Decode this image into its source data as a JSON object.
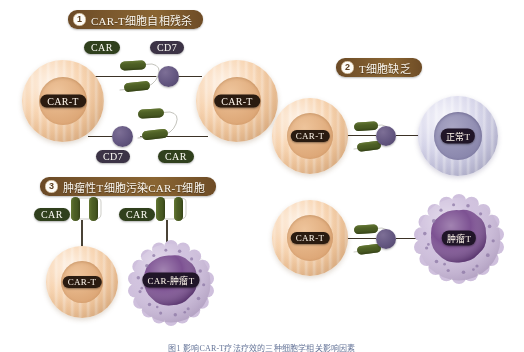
{
  "figure": {
    "background_color": "#ffffff",
    "caption": "图1 影响CAR-T疗法疗效的三种细胞学相关影响因素"
  },
  "palette": {
    "banner_brown": "#7d5a2e",
    "cart_peach": "#f6cfa8",
    "cart_nucleus": "#e3b183",
    "normal_t_lavender": "#d3d2e8",
    "normal_t_nucleus": "#9390b4",
    "tumor_membrane": "#cfc0dd",
    "tumor_nucleus": "#7a4e90",
    "car_green": "#4a5c24",
    "cd7_purple": "#655882",
    "plaque_dark": "#2a1b10"
  },
  "panels": [
    {
      "number": "1",
      "title": "CAR-T细胞自相残杀",
      "cells": [
        {
          "label": "CAR-T",
          "type": "cart"
        },
        {
          "label": "CAR-T",
          "type": "cart"
        }
      ],
      "markers": [
        {
          "name": "CAR",
          "position": "top-left"
        },
        {
          "name": "CD7",
          "position": "top-right"
        },
        {
          "name": "CD7",
          "position": "bottom-left"
        },
        {
          "name": "CAR",
          "position": "bottom-right"
        }
      ]
    },
    {
      "number": "2",
      "title": "T细胞缺乏",
      "cells": [
        {
          "label": "CAR-T",
          "type": "cart"
        },
        {
          "label": "正常T",
          "type": "normal-t"
        }
      ],
      "markers": []
    },
    {
      "number": "3",
      "title": "肿瘤性T细胞污染CAR-T细胞",
      "cells": [
        {
          "label": "CAR-T",
          "type": "cart"
        },
        {
          "label": "CAR-肿瘤T",
          "type": "tumor-t"
        }
      ],
      "markers": [
        {
          "name": "CAR",
          "position": "left"
        },
        {
          "name": "CAR",
          "position": "right"
        }
      ]
    },
    {
      "number": "4",
      "title": "",
      "cells": [
        {
          "label": "CAR-T",
          "type": "cart"
        },
        {
          "label": "肿瘤T",
          "type": "tumor-t"
        }
      ],
      "markers": []
    }
  ]
}
